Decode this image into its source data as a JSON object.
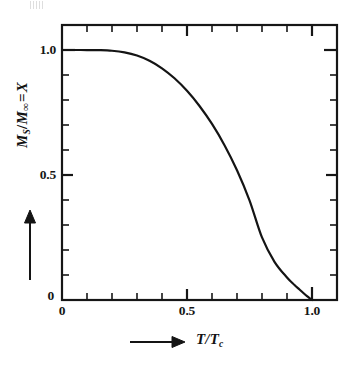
{
  "figure": {
    "background_color": "#ffffff",
    "ink_color": "#161616"
  },
  "axes": {
    "x": {
      "caption_prefix_icon": "right-arrow-icon",
      "caption": "T/T",
      "caption_subscript": "c",
      "tick_labels": [
        "0",
        "0.5",
        "1.0"
      ],
      "tick_values": [
        0,
        0.5,
        1.0
      ],
      "minor_tick_step": 0.1,
      "range": [
        0,
        1.1
      ]
    },
    "y": {
      "caption_prefix_icon": "up-arrow-icon",
      "caption_m": "M",
      "caption_m_sub": "S",
      "caption_slash": "/",
      "caption_m2": "M",
      "caption_m2_sub": "∞",
      "caption_equals": "=",
      "caption_var": "X",
      "caption_full": "M_S/M_∞ = X",
      "tick_labels": [
        "0",
        "0.5",
        "1.0"
      ],
      "tick_values": [
        0,
        0.5,
        1.0
      ],
      "minor_tick_step": 0.1,
      "range": [
        0,
        1.1
      ]
    }
  },
  "chart_data": {
    "type": "line",
    "title": "",
    "subtitle": "",
    "xlabel": "T/Tc",
    "ylabel": "Ms/M∞ = X",
    "xlim": [
      0,
      1.1
    ],
    "ylim": [
      0,
      1.1
    ],
    "grid": false,
    "legend": null,
    "legend_position": "none",
    "xticks": [
      0,
      0.5,
      1.0
    ],
    "xticklabels": [
      "0",
      "0.5",
      "1.0"
    ],
    "yticks": [
      0,
      0.5,
      1.0
    ],
    "yticklabels": [
      "0",
      "0.5",
      "1.0"
    ],
    "minor_xtick_step": 0.1,
    "minor_ytick_step": 0.1,
    "frame": "box-all-four-sides-ticks-inward",
    "series": [
      {
        "name": "Brillouin S=1/2 spontaneous magnetization",
        "color": "#141414",
        "linewidth": 2.2,
        "x": [
          0.0,
          0.05,
          0.1,
          0.15,
          0.2,
          0.25,
          0.3,
          0.35,
          0.4,
          0.45,
          0.5,
          0.55,
          0.6,
          0.65,
          0.7,
          0.75,
          0.8,
          0.85,
          0.9,
          0.93,
          0.95,
          0.97,
          0.98,
          0.99,
          0.995,
          1.0
        ],
        "y": [
          1.0,
          1.0,
          0.9999,
          0.9993,
          0.997,
          0.9907,
          0.978,
          0.957,
          0.9268,
          0.8868,
          0.8367,
          0.7761,
          0.7042,
          0.6194,
          0.5191,
          0.3989,
          0.2502,
          0.1527,
          0.09,
          0.06,
          0.042,
          0.024,
          0.0155,
          0.0075,
          0.0038,
          0.0
        ]
      }
    ]
  }
}
